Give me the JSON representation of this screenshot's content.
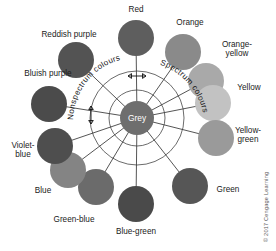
{
  "figure": {
    "center": {
      "label": "Grey",
      "cx": 137,
      "cy": 118,
      "r": 17,
      "color": "#6e6e6e"
    },
    "rings": [
      {
        "name": "inner-ring",
        "r": 28
      },
      {
        "name": "outer-ring",
        "r": 47
      }
    ],
    "region_labels": [
      {
        "id": "nonspectrum",
        "text": "Nonspectrum colours"
      },
      {
        "id": "spectrum",
        "text": "Spectrum colours"
      }
    ],
    "copyright": "© 2017 Cengage Learning",
    "nodes": [
      {
        "id": "red",
        "label": "Red",
        "color": "#5e5e5e",
        "cx": 136,
        "cy": 38,
        "r": 18,
        "lx": 136,
        "ly": 12,
        "anchor": "middle",
        "lines": [
          "Red"
        ]
      },
      {
        "id": "orange",
        "label": "Orange",
        "color": "#8a8a8a",
        "cx": 183,
        "cy": 52,
        "r": 18,
        "lx": 190,
        "ly": 25,
        "anchor": "middle",
        "lines": [
          "Orange"
        ]
      },
      {
        "id": "orange-yellow",
        "label": "Orange-yellow",
        "color": "#a9a9a9",
        "cx": 206,
        "cy": 81,
        "r": 18,
        "lx": 237,
        "ly": 47,
        "anchor": "middle",
        "lines": [
          "Orange-",
          "yellow"
        ]
      },
      {
        "id": "yellow",
        "label": "Yellow",
        "color": "#c2c2c2",
        "cx": 213,
        "cy": 103,
        "r": 18,
        "lx": 249,
        "ly": 90,
        "anchor": "middle",
        "lines": [
          "Yellow"
        ]
      },
      {
        "id": "yellow-green",
        "label": "Yellow-green",
        "color": "#9a9a9a",
        "cx": 216,
        "cy": 138,
        "r": 18,
        "lx": 248,
        "ly": 133,
        "anchor": "middle",
        "lines": [
          "Yellow-",
          "green"
        ]
      },
      {
        "id": "green",
        "label": "Green",
        "color": "#565656",
        "cx": 190,
        "cy": 186,
        "r": 18,
        "lx": 228,
        "ly": 192,
        "anchor": "middle",
        "lines": [
          "Green"
        ]
      },
      {
        "id": "blue-green",
        "label": "Blue-green",
        "color": "#4a4a4a",
        "cx": 136,
        "cy": 204,
        "r": 18,
        "lx": 136,
        "ly": 234,
        "anchor": "middle",
        "lines": [
          "Blue-green"
        ]
      },
      {
        "id": "green-blue",
        "label": "Green-blue",
        "color": "#6b6b6b",
        "cx": 96,
        "cy": 187,
        "r": 18,
        "lx": 74,
        "ly": 222,
        "anchor": "middle",
        "lines": [
          "Green-blue"
        ]
      },
      {
        "id": "blue",
        "label": "Blue",
        "color": "#848484",
        "cx": 68,
        "cy": 170,
        "r": 18,
        "lx": 43,
        "ly": 193,
        "anchor": "middle",
        "lines": [
          "Blue"
        ]
      },
      {
        "id": "violet-blue",
        "label": "Violet-blue",
        "color": "#4e4e4e",
        "cx": 55,
        "cy": 146,
        "r": 18,
        "lx": 23,
        "ly": 148,
        "anchor": "middle",
        "lines": [
          "Violet-",
          "blue"
        ]
      },
      {
        "id": "bluish-purple",
        "label": "Bluish purple",
        "color": "#4b4b4b",
        "cx": 49,
        "cy": 104,
        "r": 18,
        "lx": 48,
        "ly": 76,
        "anchor": "middle",
        "lines": [
          "Bluish purple"
        ]
      },
      {
        "id": "reddish-purple",
        "label": "Reddish purple",
        "color": "#535353",
        "cx": 76,
        "cy": 60,
        "r": 18,
        "lx": 69,
        "ly": 37,
        "anchor": "middle",
        "lines": [
          "Reddish purple"
        ]
      }
    ]
  }
}
